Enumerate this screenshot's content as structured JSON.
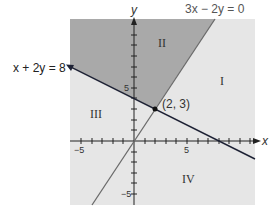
{
  "diagram": {
    "equations": {
      "line1": "x + 2y = 8",
      "line2": "3x − 2y = 0"
    },
    "intersection_label": "(2, 3)",
    "regions": [
      "I",
      "II",
      "III",
      "IV"
    ],
    "axes": {
      "x_label": "x",
      "y_label": "y",
      "x_ticks": [
        "−5",
        "5"
      ],
      "y_ticks": [
        "5",
        "−5"
      ]
    },
    "colors": {
      "background": "#ffffff",
      "plot_light": "#e6e6e6",
      "plot_dark": "#a9a9a9",
      "line1": "#1e2235",
      "line2": "#6a6a6a",
      "axis": "#222222"
    }
  }
}
